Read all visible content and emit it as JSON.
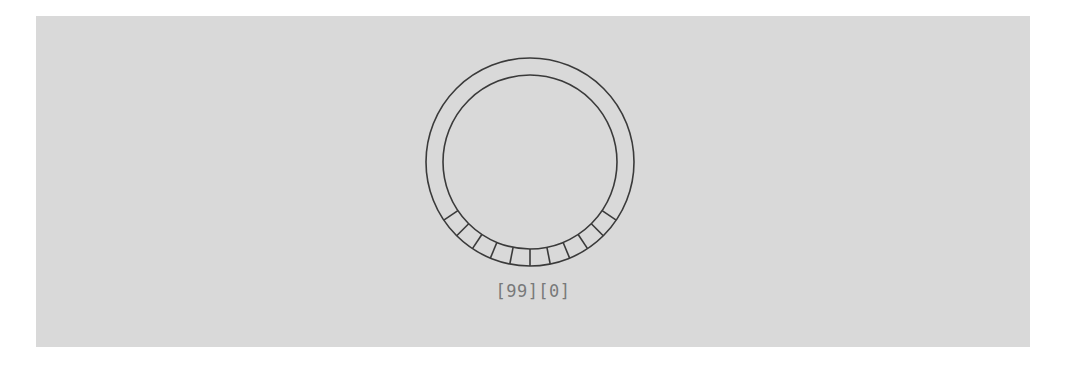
{
  "figure": {
    "name": "ring-dial",
    "background_color": "#ffffff",
    "panel_color": "#d9d9d9",
    "stroke_color": "#3a3a3a",
    "label_color": "#78797a",
    "panel": {
      "x": 36,
      "y": 16,
      "width": 994,
      "height": 331
    }
  },
  "ring": {
    "center_x": 530,
    "center_y": 162,
    "outer_radius": 104,
    "inner_radius": 87,
    "segment_ticks": 11,
    "tick_start_angle_deg": 34,
    "tick_end_angle_deg": 146,
    "tick_span_deg": 112
  },
  "labels": {
    "index_label": "[99][0]",
    "wrap_from": "[99]",
    "wrap_to": "[0]"
  },
  "chart_data": {
    "type": "pie",
    "title": "",
    "xlabel": "",
    "ylabel": "",
    "categories": [
      "[99]",
      "[0]"
    ],
    "values": [
      1,
      1
    ],
    "annotations": [
      "[99][0]"
    ],
    "legend_position": "none",
    "grid": false
  }
}
